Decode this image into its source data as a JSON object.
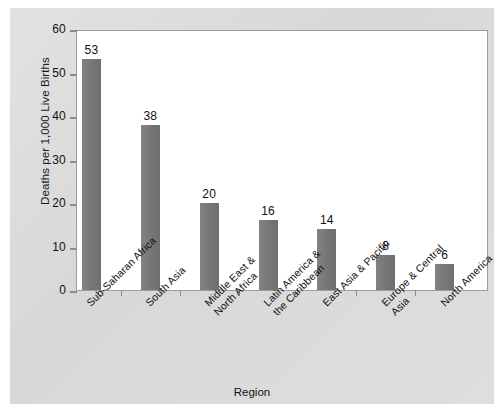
{
  "chart_data": {
    "type": "bar",
    "title": "",
    "xlabel": "Region",
    "ylabel": "Deaths per 1,000 Live Births",
    "ylim": [
      0,
      60
    ],
    "yticks": [
      0,
      10,
      20,
      30,
      40,
      50,
      60
    ],
    "ytick_labels": [
      "0",
      "10",
      "20",
      "30",
      "40",
      "50",
      "60"
    ],
    "grid": false,
    "legend": "none",
    "categories": [
      "Sub-Saharan Africa",
      "South Asia",
      "Middle East & North Africa",
      "Latin America & the Caribbean",
      "East Asia & Pacific",
      "Europe & Central Asia",
      "North America"
    ],
    "category_lines": [
      [
        "Sub-Saharan Africa",
        ""
      ],
      [
        "South Asia",
        ""
      ],
      [
        "Middle East &",
        "North Africa"
      ],
      [
        "Latin America &",
        "the Caribbean"
      ],
      [
        "East Asia & Pacific",
        ""
      ],
      [
        "Europe & Central",
        "Asia"
      ],
      [
        "North America",
        ""
      ]
    ],
    "values": [
      53,
      38,
      20,
      16,
      14,
      8,
      6
    ],
    "value_labels": [
      "53",
      "38",
      "20",
      "16",
      "14",
      "8",
      "6"
    ],
    "bar_color": "#787878",
    "plot_background": "#ffffff",
    "page_background": "#dcdcdc",
    "axis_color": "#9d9d9d"
  }
}
